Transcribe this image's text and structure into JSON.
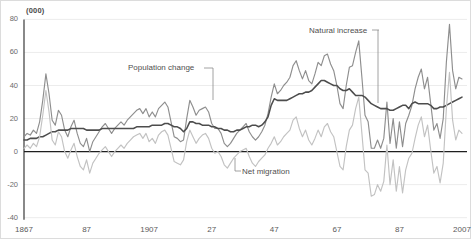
{
  "chart_data": {
    "type": "line",
    "title": "",
    "subtitle": "",
    "unit_label": "(000)",
    "xlabel": "",
    "ylabel": "",
    "grid": true,
    "legend": "inline annotations with leader lines",
    "x_start": 1867,
    "x_end": 2007,
    "xlim": [
      1867,
      2007
    ],
    "ylim": [
      -40,
      80
    ],
    "yticks": [
      80,
      60,
      40,
      20,
      0,
      -20,
      -40
    ],
    "ytick_labels": [
      "80",
      "60",
      "40",
      "20",
      "0",
      "-20",
      "-40"
    ],
    "xticks": [
      1867,
      1887,
      1907,
      1927,
      1947,
      1967,
      1987,
      2007
    ],
    "xtick_labels": [
      "1867",
      "87",
      "1907",
      "27",
      "47",
      "67",
      "87",
      "2007"
    ],
    "zero_line": 0,
    "colors": {
      "population_change": "#8e8e8e",
      "natural_increase": "#4d4d4d",
      "net_migration": "#c2c2c2",
      "gridline": "#ececec",
      "axis": "#3a3a3a",
      "text": "#5a5a5a"
    },
    "series": [
      {
        "name": "Population change",
        "color": "#8e8e8e",
        "width": 1.15,
        "annotation": {
          "text_x": 127,
          "text_y": 70,
          "dash_x1": 203,
          "dash_x2": 212,
          "dash_y": 67,
          "leader_x": 212,
          "leader_y1": 67,
          "leader_y2": 99
        },
        "values": [
          9,
          11,
          10,
          13,
          11,
          18,
          31,
          47,
          35,
          19,
          16,
          25,
          22,
          13,
          9,
          15,
          19,
          11,
          5,
          3,
          8,
          0,
          6,
          9,
          12,
          15,
          17,
          14,
          11,
          14,
          16,
          18,
          16,
          19,
          21,
          23,
          25,
          26,
          23,
          26,
          21,
          24,
          21,
          26,
          28,
          30,
          27,
          18,
          9,
          8,
          6,
          7,
          20,
          31,
          27,
          22,
          25,
          26,
          27,
          24,
          17,
          14,
          14,
          11,
          5,
          3,
          5,
          8,
          11,
          13,
          15,
          17,
          12,
          9,
          7,
          9,
          12,
          16,
          23,
          33,
          41,
          35,
          37,
          40,
          42,
          45,
          52,
          55,
          49,
          44,
          49,
          43,
          41,
          47,
          54,
          52,
          58,
          59,
          53,
          49,
          40,
          29,
          26,
          40,
          51,
          52,
          60,
          67,
          45,
          22,
          18,
          2,
          2,
          7,
          2,
          8,
          30,
          5,
          20,
          2,
          18,
          3,
          17,
          22,
          28,
          38,
          45,
          50,
          38,
          45,
          29,
          13,
          17,
          8,
          20,
          54,
          77,
          49,
          38,
          45,
          44
        ]
      },
      {
        "name": "Natural increase",
        "color": "#4d4d4d",
        "width": 1.55,
        "annotation": {
          "text_x": 308,
          "text_y": 33,
          "dash_x1": 371,
          "dash_x2": 378,
          "dash_y": 29,
          "leader_x": 377,
          "leader_y1": 29,
          "leader_y2": 102
        },
        "values": [
          7,
          7,
          8,
          8,
          8,
          9,
          9,
          10,
          11,
          12,
          12,
          13,
          13,
          13,
          13,
          14,
          14,
          14,
          14,
          14,
          13,
          13,
          13,
          13,
          13,
          14,
          14,
          14,
          14,
          14,
          14,
          14,
          14,
          14,
          14,
          14,
          15,
          15,
          15,
          15,
          15,
          16,
          16,
          16,
          16,
          17,
          17,
          16,
          15,
          15,
          14,
          12,
          14,
          18,
          18,
          17,
          17,
          16,
          16,
          16,
          15,
          15,
          14,
          14,
          13,
          13,
          12,
          12,
          13,
          13,
          14,
          15,
          15,
          16,
          16,
          15,
          16,
          18,
          21,
          28,
          32,
          31,
          31,
          31,
          31,
          32,
          33,
          34,
          35,
          35,
          36,
          36,
          37,
          39,
          41,
          43,
          43,
          42,
          41,
          40,
          40,
          38,
          37,
          37,
          38,
          36,
          34,
          34,
          34,
          33,
          31,
          29,
          28,
          27,
          26,
          26,
          26,
          25,
          25,
          26,
          27,
          28,
          28,
          26,
          29,
          30,
          29,
          29,
          29,
          29,
          28,
          26,
          26,
          27,
          27,
          28,
          29,
          30,
          31,
          32,
          33
        ]
      },
      {
        "name": "Net migration",
        "color": "#c2c2c2",
        "width": 1.15,
        "annotation": {
          "text_x": 241,
          "text_y": 174,
          "dash_x1": 234,
          "dash_x2": 240,
          "dash_y": 170,
          "leader_x": 234,
          "leader_y1": 157,
          "leader_y2": 170
        },
        "values": [
          2,
          4,
          2,
          5,
          3,
          9,
          22,
          37,
          24,
          7,
          4,
          12,
          9,
          0,
          -4,
          1,
          5,
          -3,
          -9,
          -11,
          -5,
          -13,
          -7,
          -4,
          -1,
          1,
          3,
          0,
          -3,
          0,
          2,
          4,
          2,
          5,
          7,
          9,
          10,
          11,
          8,
          11,
          6,
          8,
          5,
          10,
          12,
          13,
          10,
          2,
          -6,
          -7,
          -8,
          -5,
          6,
          13,
          9,
          5,
          8,
          10,
          11,
          8,
          2,
          -1,
          0,
          -3,
          -8,
          -10,
          -7,
          -4,
          -2,
          0,
          1,
          2,
          -3,
          -7,
          -9,
          -6,
          -4,
          -2,
          2,
          5,
          9,
          4,
          6,
          9,
          11,
          13,
          19,
          21,
          14,
          9,
          13,
          7,
          4,
          8,
          13,
          9,
          15,
          17,
          12,
          9,
          0,
          -9,
          -11,
          3,
          13,
          16,
          26,
          33,
          11,
          -11,
          -13,
          -27,
          -26,
          -20,
          -24,
          -18,
          4,
          -20,
          -5,
          -24,
          -9,
          -25,
          -11,
          -4,
          -1,
          8,
          16,
          21,
          9,
          16,
          1,
          -13,
          -9,
          -19,
          -7,
          26,
          48,
          19,
          7,
          13,
          11
        ]
      }
    ]
  }
}
